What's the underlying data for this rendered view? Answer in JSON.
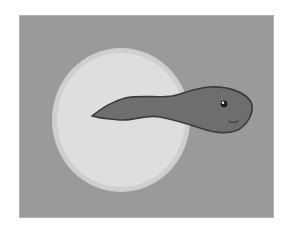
{
  "scene": {
    "subject": "tadpole",
    "background_label": "gray panel",
    "colors": {
      "page": "#ffffff",
      "panel": "#9a9a9a",
      "panel_border": "#b4b4b4",
      "circle_outer": "#cfcfcf",
      "circle_inner": "#dedede",
      "tadpole_body": "#6e6e6e",
      "tadpole_outline": "#3c3c3c",
      "eye": "#1e1e1e",
      "eye_highlight": "#ffffff"
    }
  }
}
